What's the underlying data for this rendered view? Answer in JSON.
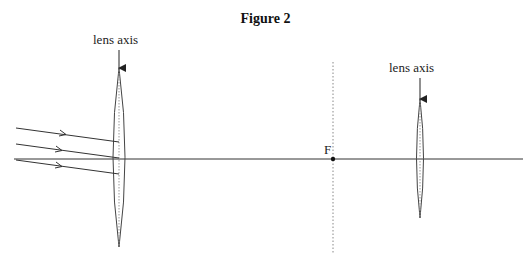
{
  "figure": {
    "title": "Figure 2",
    "labels": {
      "lens1_axis": "lens axis",
      "lens2_axis": "lens axis",
      "focal_point": "F"
    }
  },
  "geometry": {
    "principal_axis_y": 159,
    "lens1": {
      "x": 119,
      "top": 68,
      "bottom": 247,
      "half_width": 7
    },
    "lens2": {
      "x": 420,
      "top": 99,
      "bottom": 218,
      "half_width": 4
    },
    "focal_plane_x": 333,
    "rays": 3
  },
  "colors": {
    "line": "#333333",
    "dotted": "#888888",
    "background": "#ffffff"
  }
}
